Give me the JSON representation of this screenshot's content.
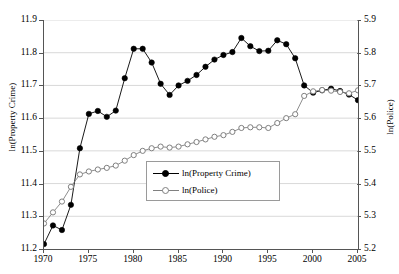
{
  "chart_data": {
    "type": "line",
    "title": "",
    "xlabel": "",
    "ylabel": "ln(Property Crime)",
    "y2label": "ln(Police)",
    "grid": true,
    "legend_position": "inside-center",
    "xlim": [
      1970,
      2005
    ],
    "ylim": [
      11.2,
      11.9
    ],
    "y2lim": [
      5.2,
      5.9
    ],
    "xticks": [
      "1970",
      "1975",
      "1980",
      "1985",
      "1990",
      "1995",
      "2000",
      "2005"
    ],
    "xtick_values": [
      1970,
      1975,
      1980,
      1985,
      1990,
      1995,
      2000,
      2005
    ],
    "yticks_left": [
      "11.2",
      "11.3",
      "11.4",
      "11.5",
      "11.6",
      "11.7",
      "11.8",
      "11.9"
    ],
    "ytick_values_left": [
      11.2,
      11.3,
      11.4,
      11.5,
      11.6,
      11.7,
      11.8,
      11.9
    ],
    "yticks_right": [
      "5.2",
      "5.3",
      "5.4",
      "5.5",
      "5.6",
      "5.7",
      "5.8",
      "5.9"
    ],
    "ytick_values_right": [
      5.2,
      5.3,
      5.4,
      5.5,
      5.6,
      5.7,
      5.8,
      5.9
    ],
    "x": [
      1970,
      1971,
      1972,
      1973,
      1974,
      1975,
      1976,
      1977,
      1978,
      1979,
      1980,
      1981,
      1982,
      1983,
      1984,
      1985,
      1986,
      1987,
      1988,
      1989,
      1990,
      1991,
      1992,
      1993,
      1994,
      1995,
      1996,
      1997,
      1998,
      1999,
      2000,
      2001,
      2002,
      2003,
      2004,
      2005
    ],
    "series": [
      {
        "name": "ln(Property Crime)",
        "axis": "left",
        "color": "#000000",
        "marker": "filled-circle",
        "values": [
          11.215,
          11.272,
          11.258,
          11.335,
          11.508,
          11.613,
          11.622,
          11.604,
          11.623,
          11.722,
          11.812,
          11.812,
          11.77,
          11.705,
          11.671,
          11.7,
          11.714,
          11.732,
          11.757,
          11.779,
          11.793,
          11.802,
          11.845,
          11.82,
          11.805,
          11.806,
          11.838,
          11.826,
          11.783,
          11.7,
          11.678,
          11.685,
          11.69,
          11.683,
          11.672,
          11.655
        ]
      },
      {
        "name": "ln(Police)",
        "axis": "right",
        "color": "#808080",
        "marker": "open-circle",
        "values": [
          5.278,
          5.312,
          5.345,
          5.39,
          5.428,
          5.437,
          5.443,
          5.448,
          5.455,
          5.47,
          5.487,
          5.5,
          5.508,
          5.513,
          5.51,
          5.513,
          5.52,
          5.527,
          5.535,
          5.543,
          5.548,
          5.558,
          5.57,
          5.572,
          5.572,
          5.57,
          5.585,
          5.6,
          5.612,
          5.668,
          5.682,
          5.686,
          5.684,
          5.68,
          5.676,
          5.685
        ]
      }
    ]
  },
  "legend": {
    "items": [
      {
        "label": "ln(Property Crime)",
        "marker": "filled-circle",
        "color": "#000000"
      },
      {
        "label": "ln(Police)",
        "marker": "open-circle",
        "color": "#808080"
      }
    ]
  },
  "axes": {
    "left_title": "ln(Property Crime)",
    "right_title": "ln(Police)"
  }
}
